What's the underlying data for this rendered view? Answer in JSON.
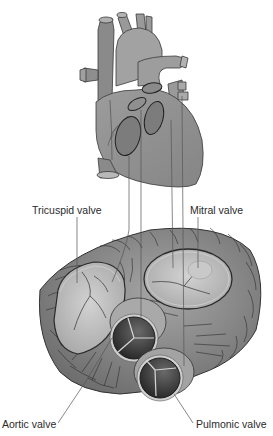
{
  "labels": {
    "tricuspid": "Tricuspid valve",
    "mitral": "Mitral valve",
    "aortic": "Aortic valve",
    "pulmonic": "Pulmonic valve"
  },
  "colors": {
    "heart_fill": "#8f8f8f",
    "heart_light": "#a8a8a8",
    "outline": "#3a3a3a",
    "valve_plane": "#8a8a8a",
    "leaflet": "#c4c4c4",
    "dark_valve": "#3c3c3c",
    "leader_line": "#555555"
  }
}
